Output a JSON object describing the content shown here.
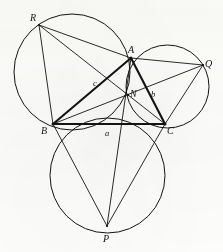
{
  "figure": {
    "canvas": {
      "width": 223,
      "height": 252
    },
    "background_color": "#fdfdfb",
    "ink_color": "#141414",
    "vertices": {
      "A": {
        "x": 131,
        "y": 58
      },
      "B": {
        "x": 53,
        "y": 124
      },
      "C": {
        "x": 165,
        "y": 124
      },
      "P": {
        "x": 107,
        "y": 226
      },
      "Q": {
        "x": 203,
        "y": 65
      },
      "R": {
        "x": 39,
        "y": 25
      },
      "N": {
        "x": 128,
        "y": 95
      }
    },
    "circles": [
      {
        "name": "circle-BCP",
        "cx": 107.5,
        "cy": 175.5,
        "r": 57.5,
        "stroke_width": 1.0
      },
      {
        "name": "circle-ABR",
        "cx": 72.0,
        "cy": 72.0,
        "r": 58.0,
        "stroke_width": 1.0
      },
      {
        "name": "circle-ACQ",
        "cx": 167.5,
        "cy": 86.5,
        "r": 41.5,
        "stroke_width": 1.0
      }
    ],
    "segments": [
      {
        "name": "side-AB",
        "from": "A",
        "to": "B",
        "weight": "thick"
      },
      {
        "name": "side-BC",
        "from": "B",
        "to": "C",
        "weight": "thick"
      },
      {
        "name": "side-CA",
        "from": "C",
        "to": "A",
        "weight": "thick"
      },
      {
        "name": "cevian-AP",
        "from": "A",
        "to": "P",
        "weight": "thin"
      },
      {
        "name": "cevian-BQ",
        "from": "B",
        "to": "Q",
        "weight": "thin"
      },
      {
        "name": "cevian-CR",
        "from": "C",
        "to": "R",
        "weight": "thin"
      },
      {
        "name": "chord-RA",
        "from": "R",
        "to": "A",
        "weight": "thin"
      },
      {
        "name": "chord-RB",
        "from": "R",
        "to": "B",
        "weight": "thin"
      },
      {
        "name": "chord-AQ",
        "from": "A",
        "to": "Q",
        "weight": "thin"
      },
      {
        "name": "chord-QC",
        "from": "Q",
        "to": "C",
        "weight": "thin"
      },
      {
        "name": "chord-BP",
        "from": "B",
        "to": "P",
        "weight": "thin"
      },
      {
        "name": "chord-PC",
        "from": "P",
        "to": "C",
        "weight": "thin"
      }
    ],
    "point_labels": [
      {
        "key": "R",
        "text": "R",
        "x": 30,
        "y": 13,
        "size": "upper"
      },
      {
        "key": "A",
        "text": "A",
        "x": 128,
        "y": 45,
        "size": "upper"
      },
      {
        "key": "Q",
        "text": "Q",
        "x": 205,
        "y": 59,
        "size": "upper"
      },
      {
        "key": "B",
        "text": "B",
        "x": 41,
        "y": 126,
        "size": "upper"
      },
      {
        "key": "C",
        "text": "C",
        "x": 167,
        "y": 126,
        "size": "upper"
      },
      {
        "key": "N",
        "text": "N",
        "x": 130,
        "y": 89,
        "size": "upper"
      },
      {
        "key": "P",
        "text": "P",
        "x": 103,
        "y": 234,
        "size": "upper"
      }
    ],
    "side_labels": [
      {
        "key": "c",
        "text": "c",
        "x": 93,
        "y": 79,
        "size": "lower"
      },
      {
        "key": "b",
        "text": "b",
        "x": 151,
        "y": 90,
        "size": "lower"
      },
      {
        "key": "a",
        "text": "a",
        "x": 105,
        "y": 129,
        "size": "lower"
      }
    ]
  }
}
